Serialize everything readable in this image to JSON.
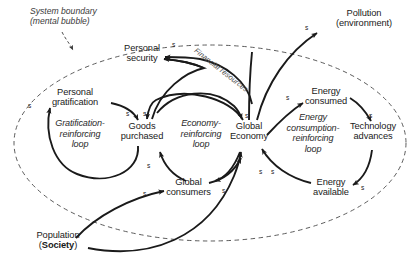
{
  "diagram": {
    "background_color": "#ffffff",
    "stroke_color": "#1a1a1a",
    "boundary": {
      "label_line1": "System boundary",
      "label_line2": "(mental bubble)",
      "style": "dashed-ellipse"
    },
    "nodes": [
      {
        "id": "personal-security",
        "label": "Personal\nsecurity"
      },
      {
        "id": "personal-gratification",
        "label": "Personal\ngratification"
      },
      {
        "id": "goods-purchased",
        "label": "Goods\npurchased"
      },
      {
        "id": "global-consumers",
        "label": "Global\nconsumers"
      },
      {
        "id": "global-economy",
        "label": "Global\nEconomy"
      },
      {
        "id": "energy-consumed",
        "label": "Energy\nconsumed"
      },
      {
        "id": "technology-advances",
        "label": "Technology\nadvances"
      },
      {
        "id": "energy-available",
        "label": "Energy\navailable"
      },
      {
        "id": "pollution",
        "label": "Pollution\n(environment)"
      },
      {
        "id": "population",
        "label_line1": "Population",
        "label_prefix": "(",
        "label_bold": "Society",
        "label_suffix": ")"
      }
    ],
    "loops": [
      {
        "id": "gratification-loop",
        "label": "Gratification-\nreinforcing\nloop"
      },
      {
        "id": "economy-loop",
        "label": "Economy-\nreinforcing\nloop"
      },
      {
        "id": "energy-loop",
        "label": "Energy\nconsumption-\nreinforcing\nloop"
      }
    ],
    "flow_labels": [
      {
        "id": "financial-resources",
        "label": "Financial resources"
      }
    ],
    "polarity_marks": [
      {
        "id": "s-gratification-loop-left",
        "label": "s"
      },
      {
        "id": "s-gratification-to-goods",
        "label": "s"
      },
      {
        "id": "s-goods-inflow-right",
        "label": "s"
      },
      {
        "id": "s-security-inflow",
        "label": "s"
      },
      {
        "id": "s-goods-from-consumers",
        "label": "s"
      },
      {
        "id": "s-population-to-consumers",
        "label": "s"
      },
      {
        "id": "s-goods-to-economy",
        "label": "s"
      },
      {
        "id": "s-economy-to-consumers",
        "label": "s"
      },
      {
        "id": "s-economy-inflow-left",
        "label": "s"
      },
      {
        "id": "s-economy-inflow-right",
        "label": "s"
      },
      {
        "id": "s-economy-to-energy-consumed",
        "label": "s"
      },
      {
        "id": "s-consumed-to-technology",
        "label": "s"
      },
      {
        "id": "s-technology-to-available",
        "label": "s"
      },
      {
        "id": "s-economy-to-pollution",
        "label": "s"
      }
    ],
    "edges": [
      {
        "from": "personal-gratification",
        "to": "goods-purchased",
        "polarity": "s"
      },
      {
        "from": "goods-purchased",
        "to": "personal-gratification",
        "polarity": "s"
      },
      {
        "from": "global-consumers",
        "to": "goods-purchased",
        "polarity": "s"
      },
      {
        "from": "global-economy",
        "to": "goods-purchased",
        "polarity": "s"
      },
      {
        "from": "goods-purchased",
        "to": "personal-security",
        "polarity": "s"
      },
      {
        "from": "global-economy",
        "to": "personal-security",
        "polarity": "s",
        "via": "financial-resources"
      },
      {
        "from": "goods-purchased",
        "to": "global-economy",
        "polarity": "s"
      },
      {
        "from": "global-economy",
        "to": "global-consumers",
        "polarity": "s"
      },
      {
        "from": "population",
        "to": "global-consumers",
        "polarity": "s"
      },
      {
        "from": "population",
        "to": "global-economy",
        "polarity": "s"
      },
      {
        "from": "global-consumers",
        "to": "global-economy",
        "polarity": "s"
      },
      {
        "from": "global-economy",
        "to": "energy-consumed",
        "polarity": "s"
      },
      {
        "from": "energy-consumed",
        "to": "technology-advances",
        "polarity": "s"
      },
      {
        "from": "technology-advances",
        "to": "energy-available",
        "polarity": "s"
      },
      {
        "from": "energy-available",
        "to": "global-economy",
        "polarity": "s"
      },
      {
        "from": "global-economy",
        "to": "pollution",
        "polarity": "s"
      }
    ]
  }
}
